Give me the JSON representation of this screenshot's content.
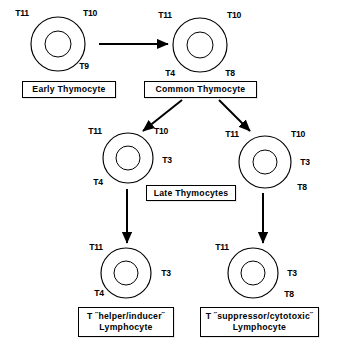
{
  "diagram": {
    "colors": {
      "ink": "#000000",
      "background": "#ffffff"
    },
    "cells": [
      {
        "id": "early-thymocyte",
        "cx": 58,
        "cy": 44,
        "r_outer": 27,
        "r_inner": 13,
        "markers": [
          {
            "text": "T11",
            "x": 22,
            "y": 16,
            "anchor": "middle"
          },
          {
            "text": "T10",
            "x": 90,
            "y": 16,
            "anchor": "middle"
          },
          {
            "text": "T9",
            "x": 84,
            "y": 69,
            "anchor": "middle"
          }
        ]
      },
      {
        "id": "common-thymocyte",
        "cx": 200,
        "cy": 45,
        "r_outer": 27,
        "r_inner": 13,
        "markers": [
          {
            "text": "T11",
            "x": 165,
            "y": 18,
            "anchor": "middle"
          },
          {
            "text": "T10",
            "x": 234,
            "y": 18,
            "anchor": "middle"
          },
          {
            "text": "T4",
            "x": 170,
            "y": 76,
            "anchor": "middle"
          },
          {
            "text": "T8",
            "x": 230,
            "y": 76,
            "anchor": "middle"
          }
        ]
      },
      {
        "id": "late-thymocyte-helper",
        "cx": 128,
        "cy": 158,
        "r_outer": 25,
        "r_inner": 12,
        "markers": [
          {
            "text": "T11",
            "x": 95,
            "y": 134,
            "anchor": "middle"
          },
          {
            "text": "T10",
            "x": 161,
            "y": 134,
            "anchor": "middle"
          },
          {
            "text": "T3",
            "x": 167,
            "y": 163,
            "anchor": "middle"
          },
          {
            "text": "T4",
            "x": 98,
            "y": 185,
            "anchor": "middle"
          }
        ]
      },
      {
        "id": "late-thymocyte-suppressor",
        "cx": 265,
        "cy": 162,
        "r_outer": 26,
        "r_inner": 12,
        "markers": [
          {
            "text": "T11",
            "x": 232,
            "y": 137,
            "anchor": "middle"
          },
          {
            "text": "T10",
            "x": 298,
            "y": 137,
            "anchor": "middle"
          },
          {
            "text": "T3",
            "x": 305,
            "y": 165,
            "anchor": "middle"
          },
          {
            "text": "T8",
            "x": 302,
            "y": 190,
            "anchor": "middle"
          }
        ]
      },
      {
        "id": "helper-inducer-lymphocyte",
        "cx": 126,
        "cy": 273,
        "r_outer": 25,
        "r_inner": 12,
        "markers": [
          {
            "text": "T11",
            "x": 96,
            "y": 250,
            "anchor": "middle"
          },
          {
            "text": "T3",
            "x": 166,
            "y": 276,
            "anchor": "middle"
          },
          {
            "text": "T4",
            "x": 99,
            "y": 296,
            "anchor": "middle"
          }
        ]
      },
      {
        "id": "suppressor-cytotoxic-lymphocyte",
        "cx": 253,
        "cy": 273,
        "r_outer": 25,
        "r_inner": 12,
        "markers": [
          {
            "text": "T11",
            "x": 222,
            "y": 250,
            "anchor": "middle"
          },
          {
            "text": "T3",
            "x": 292,
            "y": 276,
            "anchor": "middle"
          },
          {
            "text": "T8",
            "x": 289,
            "y": 297,
            "anchor": "middle"
          }
        ]
      }
    ],
    "arrows": [
      {
        "id": "early-to-common",
        "x1": 99,
        "y1": 44,
        "x2": 168,
        "y2": 44
      },
      {
        "id": "common-to-late-left",
        "x1": 182,
        "y1": 100,
        "x2": 143,
        "y2": 131
      },
      {
        "id": "common-to-late-right",
        "x1": 219,
        "y1": 100,
        "x2": 250,
        "y2": 131
      },
      {
        "id": "late-left-to-helper",
        "x1": 127,
        "y1": 189,
        "x2": 127,
        "y2": 243
      },
      {
        "id": "late-right-to-suppressor",
        "x1": 263,
        "y1": 193,
        "x2": 263,
        "y2": 243
      }
    ],
    "boxes": [
      {
        "id": "early-thymocyte-label",
        "text": "Early Thymocyte",
        "x": 22,
        "y": 81,
        "w": 94,
        "h": 17
      },
      {
        "id": "common-thymocyte-label",
        "text": "Common Thymocyte",
        "x": 144,
        "y": 81,
        "w": 113,
        "h": 17
      },
      {
        "id": "late-thymocytes-label",
        "text": "Late Thymocytes",
        "x": 146,
        "y": 185,
        "w": 90,
        "h": 16
      },
      {
        "id": "helper-inducer-label",
        "text": "T ˝helper/inducer˝\nLymphocyte",
        "x": 78,
        "y": 307,
        "w": 96,
        "h": 30
      },
      {
        "id": "suppressor-cytotoxic-label",
        "text": "T ˝suppressor/cytotoxic˝\nLymphocyte",
        "x": 200,
        "y": 307,
        "w": 119,
        "h": 30
      }
    ]
  }
}
